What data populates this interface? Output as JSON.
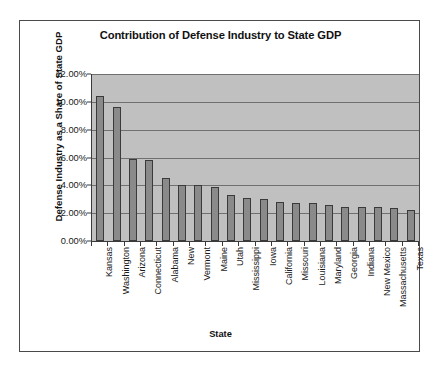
{
  "chart_data": {
    "type": "bar",
    "title": "Contribution of Defense Industry to State GDP",
    "xlabel": "State",
    "ylabel": "Defense Industry as a Share of State GDP",
    "ylim": [
      0,
      12
    ],
    "ytick_labels": [
      "12.00%",
      "10.00%",
      "8.00%",
      "6.00%",
      "4.00%",
      "2.00%",
      "0.00%"
    ],
    "ytick_values": [
      12,
      10,
      8,
      6,
      4,
      2,
      0
    ],
    "grid": true,
    "legend": "none",
    "value_unit": "percent",
    "categories": [
      "Kansas",
      "Washington",
      "Arizona",
      "Connecticut",
      "Alabama",
      "New",
      "Vermont",
      "Maine",
      "Utah",
      "Mississippi",
      "Iowa",
      "California",
      "Missouri",
      "Louisiana",
      "Maryland",
      "Georgia",
      "Indiana",
      "New Mexico",
      "Massachusetts",
      "Texas"
    ],
    "values": [
      10.4,
      9.6,
      5.9,
      5.8,
      4.5,
      4.0,
      4.0,
      3.85,
      3.3,
      3.1,
      3.0,
      2.8,
      2.75,
      2.75,
      2.6,
      2.45,
      2.45,
      2.45,
      2.35,
      2.25
    ]
  },
  "colors": {
    "bar_fill": "#8a8a8a",
    "bar_outline": "#3a3a3a",
    "plot_background": "#c0c0c0",
    "gridline": "#707070",
    "axis": "#3a3a3a",
    "page_background": "#ffffff",
    "text": "#111111"
  }
}
